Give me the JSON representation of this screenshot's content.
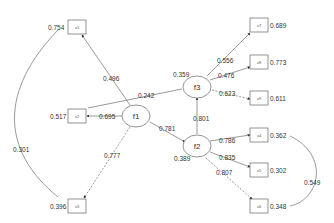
{
  "diagram": {
    "latent": [
      {
        "id": "f1",
        "label": "f1",
        "residual": ""
      },
      {
        "id": "f2",
        "label": "f2",
        "residual": "0.389"
      },
      {
        "id": "f3",
        "label": "f3",
        "residual": "0.359"
      }
    ],
    "observed": [
      {
        "id": "x1",
        "label": "x1",
        "residual": "0.754"
      },
      {
        "id": "x2",
        "label": "x2",
        "residual": "0.517"
      },
      {
        "id": "x3",
        "label": "x3",
        "residual": "0.396"
      },
      {
        "id": "x4",
        "label": "x4",
        "residual": "0.362"
      },
      {
        "id": "x5",
        "label": "x5",
        "residual": "0.302"
      },
      {
        "id": "x6",
        "label": "x6",
        "residual": "0.348"
      },
      {
        "id": "x7",
        "label": "x7",
        "residual": "0.689"
      },
      {
        "id": "x8",
        "label": "x8",
        "residual": "0.773"
      },
      {
        "id": "x9",
        "label": "x9",
        "residual": "0.611"
      }
    ],
    "loadings": {
      "f1_x1": "0.496",
      "f1_x2": "0.695",
      "f1_x3": "0.777",
      "f2_x4": "0.786",
      "f2_x5": "0.835",
      "f2_x6": "0.807",
      "f3_x7": "0.556",
      "f3_x8": "0.476",
      "f3_x9": "0.623"
    },
    "paths": {
      "f1_f2": "0.781",
      "f1_f3": "0.242",
      "f2_f3": "0.801"
    },
    "covariances": {
      "x1_x3": "0.301",
      "x4_x6": "0.549"
    }
  }
}
